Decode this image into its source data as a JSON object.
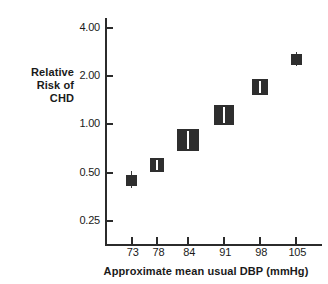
{
  "chart_data": {
    "type": "scatter",
    "title": "",
    "xlabel": "Approximate mean usual DBP (mmHg)",
    "ylabel": "Relative Risk of CHD",
    "ylabel_lines": [
      "Relative",
      "Risk of",
      "CHD"
    ],
    "yscale": "log",
    "grid": false,
    "legend": "none",
    "ylim": [
      0.18,
      4.6
    ],
    "xlim": [
      68,
      110
    ],
    "yticks": [
      "4.00",
      "2.00",
      "1.00",
      "0.50",
      "0.25"
    ],
    "ytick_values": [
      4.0,
      2.0,
      1.0,
      0.5,
      0.25
    ],
    "xticks": [
      "73",
      "78",
      "84",
      "91",
      "98",
      "105"
    ],
    "xtick_values": [
      73,
      78,
      84,
      91,
      98,
      105
    ],
    "categories": [
      73,
      78,
      84,
      91,
      98,
      105
    ],
    "values": [
      0.45,
      0.56,
      0.8,
      1.15,
      1.72,
      2.55
    ],
    "series": [
      {
        "name": "Relative risk of CHD",
        "points": [
          {
            "x": 73,
            "y": 0.45,
            "ci_low": 0.4,
            "ci_high": 0.51,
            "box_w": 11,
            "box_h": 11
          },
          {
            "x": 78,
            "y": 0.56,
            "ci_low": 0.53,
            "ci_high": 0.6,
            "box_w": 14,
            "box_h": 14
          },
          {
            "x": 84,
            "y": 0.8,
            "ci_low": 0.75,
            "ci_high": 0.86,
            "box_w": 22,
            "box_h": 22
          },
          {
            "x": 91,
            "y": 1.15,
            "ci_low": 1.08,
            "ci_high": 1.23,
            "box_w": 20,
            "box_h": 20
          },
          {
            "x": 98,
            "y": 1.72,
            "ci_low": 1.62,
            "ci_high": 1.83,
            "box_w": 16,
            "box_h": 16
          },
          {
            "x": 105,
            "y": 2.55,
            "ci_low": 2.3,
            "ci_high": 2.82,
            "box_w": 11,
            "box_h": 11
          }
        ]
      }
    ],
    "marker_style": "filled-square-sized-by-weight-with-white-center-line",
    "colors": {
      "marker": "#2e2e2e",
      "axis": "#2b2b2b",
      "marker_center_line": "#ffffff",
      "background": "#ffffff",
      "text": "#1a1a1a"
    },
    "annotations": []
  }
}
